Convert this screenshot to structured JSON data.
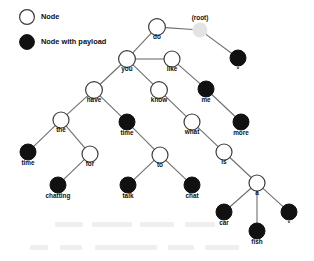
{
  "diagram": {
    "legend": {
      "items": [
        {
          "id": "legend-node",
          "label": "Node",
          "style": "open",
          "cx": 27,
          "cy": 17,
          "r": 7.4,
          "text_x": 41,
          "text_y": 17
        },
        {
          "id": "legend-node-payload",
          "label": "Node with payload",
          "style": "payload",
          "cx": 27,
          "cy": 42,
          "r": 7.4,
          "text_x": 41,
          "text_y": 42
        }
      ]
    },
    "nodes": [
      {
        "id": "root",
        "label": "(root)",
        "style": "root",
        "cx": 200,
        "cy": 30,
        "r": 7.4,
        "label_pos": "above",
        "label_dy": -12
      },
      {
        "id": "do",
        "label": "do",
        "style": "open",
        "cx": 157,
        "cy": 27,
        "r": 8.4,
        "label_pos": "below",
        "label_dy": 10
      },
      {
        "id": "star1",
        "label": "*",
        "style": "payload",
        "cx": 238,
        "cy": 58,
        "r": 8.0,
        "label_pos": "below",
        "label_dy": 11
      },
      {
        "id": "you",
        "label": "you",
        "style": "open",
        "cx": 127,
        "cy": 59,
        "r": 8.4,
        "label_pos": "below",
        "label_dy": 10
      },
      {
        "id": "like",
        "label": "like",
        "style": "open",
        "cx": 172,
        "cy": 59,
        "r": 8.0,
        "label_pos": "below",
        "label_dy": 10
      },
      {
        "id": "me",
        "label": "me",
        "style": "payload",
        "cx": 206,
        "cy": 89,
        "r": 8.0,
        "label_pos": "below",
        "label_dy": 11
      },
      {
        "id": "more",
        "label": "more",
        "style": "payload",
        "cx": 241,
        "cy": 122,
        "r": 8.0,
        "label_pos": "below",
        "label_dy": 11
      },
      {
        "id": "have",
        "label": "have",
        "style": "open",
        "cx": 94,
        "cy": 90,
        "r": 8.4,
        "label_pos": "below",
        "label_dy": 10
      },
      {
        "id": "know",
        "label": "know",
        "style": "open",
        "cx": 159,
        "cy": 90,
        "r": 8.4,
        "label_pos": "below",
        "label_dy": 10
      },
      {
        "id": "the",
        "label": "the",
        "style": "open",
        "cx": 61,
        "cy": 120,
        "r": 8.0,
        "label_pos": "below",
        "label_dy": 10
      },
      {
        "id": "time1",
        "label": "time",
        "style": "payload",
        "cx": 127,
        "cy": 122,
        "r": 8.0,
        "label_pos": "below",
        "label_dy": 11
      },
      {
        "id": "what",
        "label": "what",
        "style": "open",
        "cx": 192,
        "cy": 122,
        "r": 8.0,
        "label_pos": "below",
        "label_dy": 10
      },
      {
        "id": "time2",
        "label": "time",
        "style": "payload",
        "cx": 28,
        "cy": 152,
        "r": 8.0,
        "label_pos": "below",
        "label_dy": 11
      },
      {
        "id": "for",
        "label": "for",
        "style": "open",
        "cx": 90,
        "cy": 154,
        "r": 8.0,
        "label_pos": "below",
        "label_dy": 10
      },
      {
        "id": "to",
        "label": "to",
        "style": "open",
        "cx": 160,
        "cy": 155,
        "r": 8.0,
        "label_pos": "below",
        "label_dy": 10
      },
      {
        "id": "is",
        "label": "is",
        "style": "open",
        "cx": 224,
        "cy": 152,
        "r": 8.0,
        "label_pos": "below",
        "label_dy": 10
      },
      {
        "id": "chatting",
        "label": "chatting",
        "style": "payload",
        "cx": 58,
        "cy": 185,
        "r": 8.0,
        "label_pos": "below",
        "label_dy": 11
      },
      {
        "id": "talk",
        "label": "talk",
        "style": "payload",
        "cx": 128,
        "cy": 185,
        "r": 8.0,
        "label_pos": "below",
        "label_dy": 11
      },
      {
        "id": "chat",
        "label": "chat",
        "style": "payload",
        "cx": 192,
        "cy": 185,
        "r": 8.0,
        "label_pos": "below",
        "label_dy": 11
      },
      {
        "id": "a",
        "label": "a",
        "style": "open",
        "cx": 257,
        "cy": 183,
        "r": 8.0,
        "label_pos": "below",
        "label_dy": 10
      },
      {
        "id": "car",
        "label": "car",
        "style": "payload",
        "cx": 224,
        "cy": 212,
        "r": 8.0,
        "label_pos": "below",
        "label_dy": 11
      },
      {
        "id": "fish",
        "label": "fish",
        "style": "payload",
        "cx": 257,
        "cy": 231,
        "r": 8.0,
        "label_pos": "below",
        "label_dy": 11
      },
      {
        "id": "star2",
        "label": "*",
        "style": "payload",
        "cx": 289,
        "cy": 212,
        "r": 8.0,
        "label_pos": "below",
        "label_dy": 11
      }
    ],
    "edges": [
      {
        "id": "edge-do-root",
        "from": "do",
        "to": "root"
      },
      {
        "id": "edge-root-star1",
        "from": "root",
        "to": "star1"
      },
      {
        "id": "edge-do-you",
        "from": "do",
        "to": "you"
      },
      {
        "id": "edge-you-like",
        "from": "you",
        "to": "like"
      },
      {
        "id": "edge-like-me",
        "from": "like",
        "to": "me"
      },
      {
        "id": "edge-me-more",
        "from": "me",
        "to": "more"
      },
      {
        "id": "edge-you-have",
        "from": "you",
        "to": "have"
      },
      {
        "id": "edge-you-know",
        "from": "you",
        "to": "know"
      },
      {
        "id": "edge-have-the",
        "from": "have",
        "to": "the"
      },
      {
        "id": "edge-have-time1",
        "from": "have",
        "to": "time1"
      },
      {
        "id": "edge-know-what",
        "from": "know",
        "to": "what"
      },
      {
        "id": "edge-the-time2",
        "from": "the",
        "to": "time2"
      },
      {
        "id": "edge-the-for",
        "from": "the",
        "to": "for"
      },
      {
        "id": "edge-time1-to",
        "from": "time1",
        "to": "to"
      },
      {
        "id": "edge-what-is",
        "from": "what",
        "to": "is"
      },
      {
        "id": "edge-for-chatting",
        "from": "for",
        "to": "chatting"
      },
      {
        "id": "edge-to-talk",
        "from": "to",
        "to": "talk"
      },
      {
        "id": "edge-to-chat",
        "from": "to",
        "to": "chat"
      },
      {
        "id": "edge-is-a",
        "from": "is",
        "to": "a"
      },
      {
        "id": "edge-a-car",
        "from": "a",
        "to": "car"
      },
      {
        "id": "edge-a-fish",
        "from": "a",
        "to": "fish"
      },
      {
        "id": "edge-a-star2",
        "from": "a",
        "to": "star2"
      }
    ],
    "colors": {
      "node_open_fill": "#ffffff",
      "node_open_stroke": "#3c3c3c",
      "node_payload_fill": "#111111",
      "node_root_fill": "#e3e3e3",
      "edge_stroke": "#6e6e6e",
      "label_text": "#101010",
      "background": "#ffffff"
    }
  }
}
